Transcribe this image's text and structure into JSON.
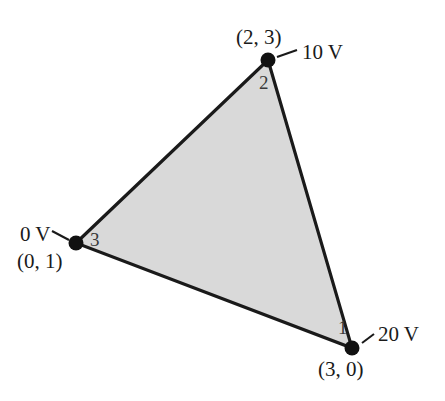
{
  "figure": {
    "name": "triangular-finite-element",
    "background_color": "#ffffff",
    "fill_color": "#d9d9d9",
    "edge_color": "#1a1a1a",
    "edge_width_px": 3,
    "vertex_dot_color": "#111111"
  },
  "vertices": [
    {
      "node_number": "1",
      "coordinate_label": "(3, 0)",
      "potential_label": "20 V",
      "px": 352,
      "py": 348,
      "node_px": 338,
      "node_py": 318,
      "coord_px": 318,
      "coord_py": 359,
      "volt_px": 378,
      "volt_py": 324,
      "leader": {
        "x1": 362,
        "y1": 343,
        "x2": 374,
        "y2": 334
      }
    },
    {
      "node_number": "2",
      "coordinate_label": "(2, 3)",
      "potential_label": "10 V",
      "px": 268,
      "py": 60,
      "node_px": 259,
      "node_py": 73,
      "coord_px": 236,
      "coord_py": 27,
      "volt_px": 302,
      "volt_py": 42,
      "leader": {
        "x1": 277,
        "y1": 57,
        "x2": 297,
        "y2": 50
      }
    },
    {
      "node_number": "3",
      "coordinate_label": "(0, 1)",
      "potential_label": "0 V",
      "px": 76,
      "py": 243,
      "node_px": 90,
      "node_py": 230,
      "coord_px": 17,
      "coord_py": 251,
      "volt_px": 20,
      "volt_py": 224,
      "leader": {
        "x1": 52,
        "y1": 231,
        "x2": 69,
        "y2": 240
      }
    }
  ]
}
